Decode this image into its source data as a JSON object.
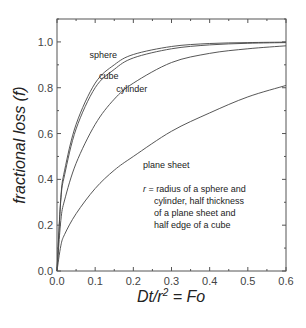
{
  "chart_data": {
    "type": "line",
    "title": "",
    "xlabel": "Dt/r² = Fo",
    "xlabel_parts": {
      "main": "Dt/r",
      "sup": "2",
      "rest": " = Fo"
    },
    "ylabel": "fractional loss (f)",
    "xlim": [
      0.0,
      0.6
    ],
    "ylim": [
      0.0,
      1.1
    ],
    "xticks": [
      "0.0",
      "0.1",
      "0.2",
      "0.3",
      "0.4",
      "0.5",
      "0.6"
    ],
    "yticks": [
      "0.0",
      "0.2",
      "0.4",
      "0.6",
      "0.8",
      "1.0"
    ],
    "grid": false,
    "legend": "none (inline labels)",
    "x": [
      0.0,
      0.01,
      0.02,
      0.05,
      0.1,
      0.15,
      0.2,
      0.3,
      0.4,
      0.5,
      0.6
    ],
    "series": [
      {
        "name": "sphere",
        "values": [
          0.0,
          0.32,
          0.44,
          0.64,
          0.82,
          0.9,
          0.945,
          0.98,
          0.993,
          0.997,
          0.999
        ]
      },
      {
        "name": "cube",
        "values": [
          0.0,
          0.31,
          0.42,
          0.62,
          0.8,
          0.88,
          0.93,
          0.97,
          0.987,
          0.994,
          0.997
        ]
      },
      {
        "name": "cylinder",
        "values": [
          0.0,
          0.22,
          0.31,
          0.47,
          0.64,
          0.75,
          0.82,
          0.91,
          0.95,
          0.97,
          0.983
        ]
      },
      {
        "name": "plane sheet",
        "values": [
          0.0,
          0.11,
          0.16,
          0.25,
          0.36,
          0.44,
          0.5,
          0.61,
          0.69,
          0.76,
          0.81
        ]
      }
    ],
    "curve_labels": [
      {
        "text": "sphere",
        "x": 0.085,
        "y": 0.93
      },
      {
        "text": "cube",
        "x": 0.11,
        "y": 0.84
      },
      {
        "text": "cylinder",
        "x": 0.155,
        "y": 0.78
      },
      {
        "text": "plane sheet",
        "x": 0.225,
        "y": 0.45
      }
    ],
    "annotation": {
      "lines": [
        "r = radius of a sphere and",
        "cylinder, half thickness",
        "of a plane sheet and",
        "half edge of a cube"
      ],
      "x": 0.225,
      "y": 0.345
    }
  }
}
